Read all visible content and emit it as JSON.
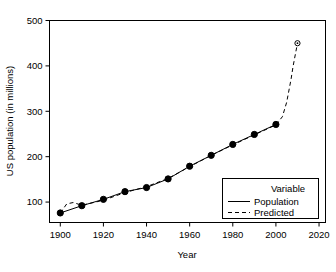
{
  "chart_data": {
    "type": "line",
    "title": "",
    "xlabel": "Year",
    "ylabel": "US population (in millions)",
    "xlim": [
      1895,
      2023
    ],
    "ylim": [
      55,
      500
    ],
    "xticks": [
      1900,
      1920,
      1940,
      1960,
      1980,
      2000,
      2020
    ],
    "xticklabels": [
      "1900",
      "1920",
      "1940",
      "1960",
      "1980",
      "2000",
      "2020"
    ],
    "yticks": [
      100,
      200,
      300,
      400,
      500
    ],
    "yticklabels": [
      "100",
      "200",
      "300",
      "400",
      "500"
    ],
    "grid": false,
    "legend_position": "lower-right",
    "legend_title": "Variable",
    "series": [
      {
        "name": "Population",
        "style": "solid",
        "marker": "filled-circle",
        "color": "#000000",
        "x": [
          1900,
          1910,
          1920,
          1930,
          1940,
          1950,
          1960,
          1970,
          1980,
          1990,
          2000
        ],
        "values": [
          76,
          92,
          106,
          123,
          132,
          151,
          179,
          203,
          227,
          249,
          271
        ]
      },
      {
        "name": "Predicted",
        "style": "dashed",
        "marker": "open-circle",
        "color": "#000000",
        "x": [
          1900,
          1903,
          1906,
          1910,
          1920,
          1930,
          1940,
          1950,
          1960,
          1970,
          1980,
          1990,
          2000,
          2003,
          2005,
          2007,
          2008,
          2010
        ],
        "values": [
          76,
          96,
          99,
          93,
          104,
          121,
          134,
          152,
          178,
          203,
          226,
          248,
          270,
          288,
          320,
          370,
          400,
          450
        ]
      }
    ]
  },
  "legend": {
    "title": "Variable",
    "entries": [
      {
        "label": "Population",
        "style": "solid"
      },
      {
        "label": "Predicted",
        "style": "dashed"
      }
    ]
  },
  "axes": {
    "x_title": "Year",
    "y_title": "US population (in millions)"
  }
}
